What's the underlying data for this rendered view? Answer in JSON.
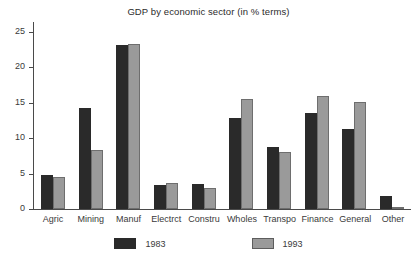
{
  "chart_data": {
    "type": "bar",
    "title": "GDP by economic sector (in % terms)",
    "xlabel": "",
    "ylabel": "",
    "ylim": [
      0,
      26.5
    ],
    "yticks": [
      0,
      5,
      10,
      15,
      20,
      25
    ],
    "grid": false,
    "legend_position": "bottom",
    "categories": [
      "Agric",
      "Mining",
      "Manuf",
      "Electrct",
      "Constru",
      "Wholes",
      "Transpo",
      "Finance",
      "General",
      "Other"
    ],
    "series": [
      {
        "name": "1983",
        "color": "#2a2a2a",
        "values": [
          4.8,
          14.3,
          23.1,
          3.4,
          3.5,
          12.8,
          8.8,
          13.6,
          11.3,
          1.9
        ]
      },
      {
        "name": "1993",
        "color": "#9a9a9a",
        "values": [
          4.5,
          8.3,
          23.3,
          3.7,
          3.0,
          15.5,
          8.0,
          15.9,
          15.1,
          0.3
        ]
      }
    ]
  }
}
